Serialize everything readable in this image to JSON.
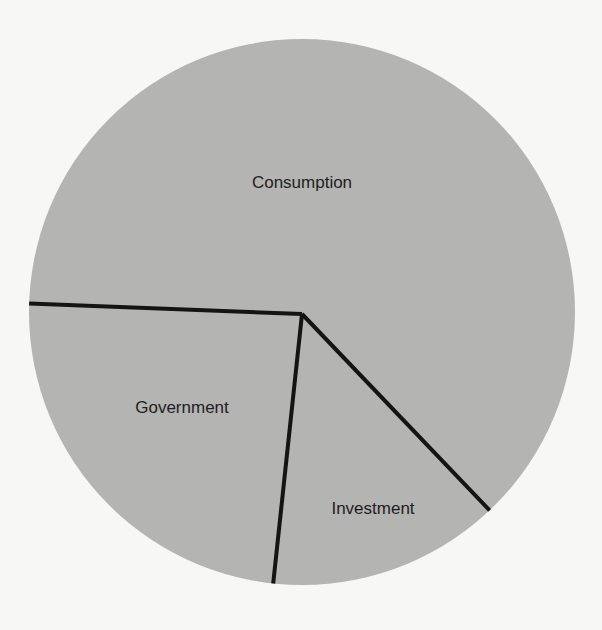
{
  "chart_data": {
    "type": "pie",
    "title": "",
    "categories": [
      "Consumption",
      "Government",
      "Investment"
    ],
    "values": [
      62,
      24,
      14
    ],
    "unit": "% (estimated from slice angles; no values printed)",
    "slices": [
      {
        "label": "Consumption",
        "value": 62,
        "start_angle_deg": 182.2,
        "end_angle_deg": 406.3,
        "label_pos": [
          302,
          182
        ]
      },
      {
        "label": "Government",
        "value": 24,
        "start_angle_deg": 96.1,
        "end_angle_deg": 182.2,
        "label_pos": [
          182,
          407
        ]
      },
      {
        "label": "Investment",
        "value": 14,
        "start_angle_deg": 46.3,
        "end_angle_deg": 96.1,
        "label_pos": [
          373,
          508
        ]
      }
    ],
    "legend": "none (labels drawn inside slices)",
    "colors": {
      "fill": "#b4b4b2",
      "divider": "#141414",
      "background": "#f7f7f5",
      "text": "#1e1e1e"
    },
    "geometry": {
      "cx": 302,
      "cy": 312,
      "r": 273,
      "center_point": [
        302,
        314
      ]
    }
  }
}
